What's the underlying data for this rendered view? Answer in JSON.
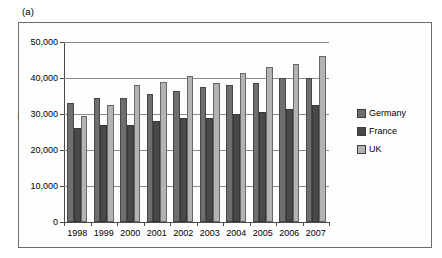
{
  "figure": {
    "panel_label": "(a)",
    "y_axis_title": "Euros"
  },
  "legend": {
    "position": "right",
    "items": [
      {
        "label": "Germany",
        "color": "#6e6e6e"
      },
      {
        "label": "France",
        "color": "#494949"
      },
      {
        "label": "UK",
        "color": "#b3b3b3"
      }
    ]
  },
  "axes": {
    "y_ticks": [
      "0",
      "10,000",
      "20,000",
      "30,000",
      "40,000",
      "50,000"
    ],
    "y_tick_values": [
      0,
      10000,
      20000,
      30000,
      40000,
      50000
    ],
    "x_ticks": [
      "1998",
      "1999",
      "2000",
      "2001",
      "2002",
      "2003",
      "2004",
      "2005",
      "2006",
      "2007"
    ]
  },
  "chart_data": {
    "type": "bar",
    "title": "(a)",
    "xlabel": "",
    "ylabel": "Euros",
    "ylim": [
      0,
      50000
    ],
    "grid": true,
    "legend_position": "right",
    "categories": [
      "1998",
      "1999",
      "2000",
      "2001",
      "2002",
      "2003",
      "2004",
      "2005",
      "2006",
      "2007"
    ],
    "series": [
      {
        "name": "Germany",
        "color": "#6e6e6e",
        "values": [
          33000,
          34500,
          34500,
          35500,
          36500,
          37500,
          38000,
          38500,
          40000,
          40000
        ]
      },
      {
        "name": "France",
        "color": "#494949",
        "values": [
          26000,
          27000,
          27000,
          28000,
          29000,
          29000,
          30000,
          30500,
          31500,
          32500
        ]
      },
      {
        "name": "UK",
        "color": "#b3b3b3",
        "values": [
          29500,
          32500,
          38000,
          39000,
          40500,
          38500,
          41500,
          43000,
          44000,
          46000
        ]
      }
    ]
  }
}
